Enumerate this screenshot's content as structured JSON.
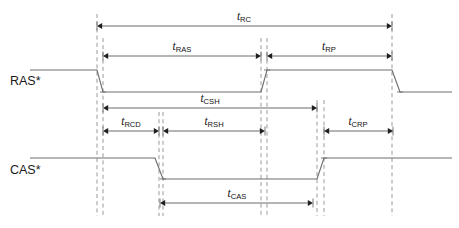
{
  "diagram": {
    "canvas": {
      "width": 459,
      "height": 228,
      "background": "#ffffff"
    },
    "colors": {
      "waveform": "#6e6e6e",
      "guide_line": "#9a9a9a",
      "measure_line": "#6b6b6b",
      "arrow_head": "#1f1f1f",
      "text": "#111111"
    }
  },
  "signals": [
    {
      "id": "ras",
      "label": "RAS*",
      "label_x": 10,
      "label_y": 85,
      "high_y": 70,
      "low_y": 92,
      "start_x": 30,
      "end_x": 452,
      "edges": [
        {
          "type": "fall",
          "x_start": 97,
          "x_end": 103
        },
        {
          "type": "rise",
          "x_start": 261,
          "x_end": 267
        },
        {
          "type": "fall",
          "x_start": 392,
          "x_end": 400
        }
      ]
    },
    {
      "id": "cas",
      "label": "CAS*",
      "label_x": 10,
      "label_y": 174,
      "high_y": 158,
      "low_y": 179,
      "start_x": 30,
      "end_x": 452,
      "edges": [
        {
          "type": "fall",
          "x_start": 155,
          "x_end": 163
        },
        {
          "type": "rise",
          "x_start": 317,
          "x_end": 324
        }
      ]
    }
  ],
  "guides": [
    {
      "id": "guide-ras-fall-a",
      "x": 97,
      "y_top": 14,
      "y_bottom": 216
    },
    {
      "id": "guide-ras-fall-b",
      "x": 103,
      "y_top": 38,
      "y_bottom": 216
    },
    {
      "id": "guide-cas-fall-a",
      "x": 159,
      "y_top": 112,
      "y_bottom": 216
    },
    {
      "id": "guide-cas-fall-b",
      "x": 163,
      "y_top": 112,
      "y_bottom": 216
    },
    {
      "id": "guide-ras-rise-a",
      "x": 261,
      "y_top": 38,
      "y_bottom": 216
    },
    {
      "id": "guide-ras-rise-b",
      "x": 267,
      "y_top": 38,
      "y_bottom": 216
    },
    {
      "id": "guide-cas-rise-a",
      "x": 317,
      "y_top": 100,
      "y_bottom": 216
    },
    {
      "id": "guide-cas-rise-b",
      "x": 324,
      "y_top": 100,
      "y_bottom": 216
    },
    {
      "id": "guide-cycle-end",
      "x": 392,
      "y_top": 14,
      "y_bottom": 216
    }
  ],
  "measurements": [
    {
      "id": "trc",
      "symbol": "t",
      "subscript": "RC",
      "x_start": 97,
      "x_end": 392,
      "y": 26,
      "label_x": 244,
      "label_y": 20,
      "arrows": "both"
    },
    {
      "id": "tras",
      "symbol": "t",
      "subscript": "RAS",
      "x_start": 103,
      "x_end": 261,
      "y": 56,
      "label_x": 182,
      "label_y": 50,
      "arrows": "both"
    },
    {
      "id": "trp",
      "symbol": "t",
      "subscript": "RP",
      "x_start": 267,
      "x_end": 392,
      "y": 56,
      "label_x": 329,
      "label_y": 50,
      "arrows": "both"
    },
    {
      "id": "tcsh",
      "symbol": "t",
      "subscript": "CSH",
      "x_start": 103,
      "x_end": 317,
      "y": 108,
      "label_x": 210,
      "label_y": 102,
      "arrows": "both"
    },
    {
      "id": "trcd",
      "symbol": "t",
      "subscript": "RCD",
      "x_start": 103,
      "x_end": 159,
      "y": 131,
      "label_x": 131,
      "label_y": 125,
      "arrows": "both"
    },
    {
      "id": "trsh",
      "symbol": "t",
      "subscript": "RSH",
      "x_start": 163,
      "x_end": 265,
      "y": 131,
      "label_x": 214,
      "label_y": 125,
      "arrows": "both"
    },
    {
      "id": "tcrp",
      "symbol": "t",
      "subscript": "CRP",
      "x_start": 324,
      "x_end": 393,
      "y": 131,
      "label_x": 358,
      "label_y": 125,
      "arrows": "both"
    },
    {
      "id": "tcas",
      "symbol": "t",
      "subscript": "CAS",
      "x_start": 160,
      "x_end": 313,
      "y": 203,
      "label_x": 237,
      "label_y": 197,
      "arrows": "both"
    }
  ]
}
